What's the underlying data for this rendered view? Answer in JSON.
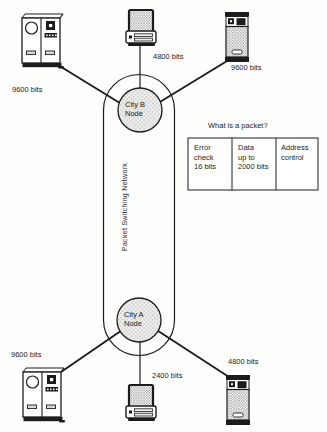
{
  "diagram": {
    "network_label": "Packet Switching Network",
    "node_top": {
      "line1": "City B",
      "line2": "Node"
    },
    "node_bottom": {
      "line1": "City A",
      "line2": "Node"
    },
    "links": {
      "top_left": "9600 bits",
      "top_middle": "4800 bits",
      "top_right": "9600 bits",
      "bottom_left": "9600 bits",
      "bottom_middle": "2400 bits",
      "bottom_right": "4800 bits"
    },
    "packet_box": {
      "title": "What is a packet?",
      "cells": [
        {
          "lines": [
            "Error",
            "check",
            "16 bits"
          ]
        },
        {
          "lines": [
            "Data",
            "up to",
            "2000 bits"
          ]
        },
        {
          "lines": [
            "Address",
            "control",
            ""
          ]
        }
      ]
    },
    "colors": {
      "ink": "#1c1c1c",
      "hatch_gray": "#8f8f8f",
      "dot_gray": "#a8a8a8",
      "slot_gray": "#d8d8d8",
      "background": "#ffffff"
    }
  }
}
